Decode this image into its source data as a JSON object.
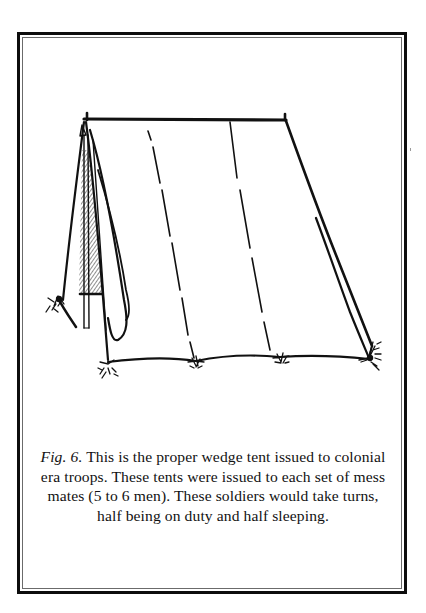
{
  "figure": {
    "label": "Fig. 6.",
    "caption_lines": [
      " This is the proper wedge tent issued to colonial",
      "era troops.  These tents were issued to each set of mess",
      "mates (5 to 6 men).  These soldiers would take turns,",
      "half being on duty and half sleeping."
    ],
    "illustration": {
      "subject": "wedge-tent",
      "description": "Line drawing of a colonial-era wedge tent with ridge pole, front flaps tied open, and grass tufts at the stakes"
    }
  },
  "colors": {
    "ink": "#111111",
    "frame": "#0d0d0d",
    "frame_inner": "#6b6b6b",
    "paper": "#ffffff"
  }
}
